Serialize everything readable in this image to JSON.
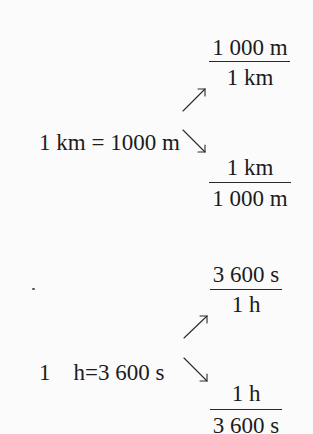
{
  "conversions": [
    {
      "equation": {
        "left_qty": "1 km",
        "equals": "=",
        "right_qty": "1000 m"
      },
      "factor_top": {
        "numerator": "1 000 m",
        "denominator": "1 km"
      },
      "factor_bottom": {
        "numerator": "1 km",
        "denominator": "1 000 m"
      }
    },
    {
      "equation": {
        "left_qty": "1    h",
        "equals": "=",
        "right_qty": "3 600 s"
      },
      "factor_top": {
        "numerator": "3 600 s",
        "denominator": "1 h"
      },
      "factor_bottom": {
        "numerator": "1 h",
        "denominator": "3 600 s"
      }
    }
  ],
  "icons": {
    "arrow_up": "arrow-up-right-icon",
    "arrow_down": "arrow-down-right-icon"
  },
  "colors": {
    "text": "#1c1c1c",
    "background": "#fbfbfb"
  }
}
